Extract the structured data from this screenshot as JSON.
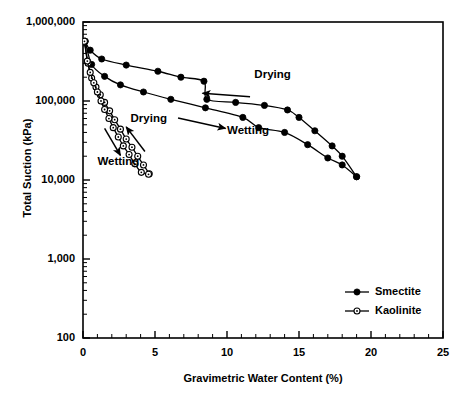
{
  "chart_data": {
    "type": "line",
    "title": "",
    "xlabel": "Gravimetric Water Content (%)",
    "ylabel": "Total Suction (kPa)",
    "xlim": [
      0,
      25
    ],
    "ylim": [
      100,
      1000000
    ],
    "yscale": "log",
    "xscale": "linear",
    "grid": false,
    "xticks": [
      "0",
      "5",
      "10",
      "15",
      "20",
      "25"
    ],
    "xtick_values": [
      0,
      5,
      10,
      15,
      20,
      25
    ],
    "xtick_minor_step": 1,
    "yticks": [
      "100",
      "1,000",
      "10,000",
      "100,000",
      "1,000,000"
    ],
    "ytick_values": [
      100,
      1000,
      10000,
      100000,
      1000000
    ],
    "legend_position": "lower-right",
    "legend": [
      {
        "name": "Smectite",
        "marker": "filled-circle"
      },
      {
        "name": "Kaolinite",
        "marker": "open-circle"
      }
    ],
    "annotations": [
      {
        "text": "Drying",
        "x": 11.9,
        "y": 210000,
        "arrow_from": [
          11.6,
          113000
        ],
        "arrow_to": [
          8.3,
          125000
        ]
      },
      {
        "text": "Wetting",
        "x": 10.0,
        "y": 41000,
        "arrow_from": [
          6.6,
          61000
        ],
        "arrow_to": [
          9.9,
          45000
        ]
      },
      {
        "text": "Drying",
        "x": 3.3,
        "y": 58000,
        "arrow_from": [
          4.3,
          23000
        ],
        "arrow_to": [
          3.0,
          47000
        ]
      },
      {
        "text": "Wetting",
        "x": 1.0,
        "y": 16500,
        "arrow_from": [
          1.5,
          45000
        ],
        "arrow_to": [
          2.6,
          20500
        ]
      }
    ],
    "series": [
      {
        "name": "Smectite",
        "branch": "drying",
        "marker": "filled-circle",
        "points": [
          [
            0.15,
            570000
          ],
          [
            0.5,
            440000
          ],
          [
            1.3,
            340000
          ],
          [
            3.0,
            285000
          ],
          [
            5.2,
            238000
          ],
          [
            6.8,
            200000
          ],
          [
            8.4,
            178000
          ],
          [
            8.6,
            105000
          ],
          [
            10.6,
            96000
          ],
          [
            12.6,
            88000
          ],
          [
            14.2,
            77000
          ],
          [
            15.0,
            62000
          ],
          [
            16.1,
            42000
          ],
          [
            17.3,
            27000
          ],
          [
            18.0,
            20000
          ],
          [
            19.0,
            11000
          ]
        ]
      },
      {
        "name": "Smectite",
        "branch": "wetting",
        "marker": "filled-circle",
        "points": [
          [
            0.15,
            570000
          ],
          [
            0.6,
            290000
          ],
          [
            1.5,
            205000
          ],
          [
            2.6,
            160000
          ],
          [
            4.2,
            130000
          ],
          [
            6.1,
            105000
          ],
          [
            8.5,
            82000
          ],
          [
            11.1,
            62000
          ],
          [
            12.2,
            46000
          ],
          [
            14.0,
            40000
          ],
          [
            15.6,
            28000
          ],
          [
            17.0,
            19000
          ],
          [
            18.0,
            15500
          ],
          [
            19.0,
            11000
          ]
        ]
      },
      {
        "name": "Kaolinite",
        "branch": "drying",
        "marker": "open-circle",
        "points": [
          [
            0.1,
            570000
          ],
          [
            0.35,
            300000
          ],
          [
            0.6,
            195000
          ],
          [
            0.9,
            150000
          ],
          [
            1.2,
            120000
          ],
          [
            1.5,
            96000
          ],
          [
            1.85,
            75000
          ],
          [
            2.2,
            58000
          ],
          [
            2.6,
            44000
          ],
          [
            3.0,
            33000
          ],
          [
            3.4,
            26000
          ],
          [
            3.8,
            20000
          ],
          [
            4.2,
            15500
          ],
          [
            4.6,
            12000
          ]
        ]
      },
      {
        "name": "Kaolinite",
        "branch": "wetting",
        "marker": "open-circle",
        "points": [
          [
            0.1,
            570000
          ],
          [
            0.3,
            320000
          ],
          [
            0.5,
            230000
          ],
          [
            0.75,
            170000
          ],
          [
            1.0,
            130000
          ],
          [
            1.25,
            100000
          ],
          [
            1.5,
            78000
          ],
          [
            1.8,
            60000
          ],
          [
            2.1,
            46000
          ],
          [
            2.45,
            35000
          ],
          [
            2.8,
            27000
          ],
          [
            3.2,
            21000
          ],
          [
            3.6,
            16000
          ],
          [
            4.05,
            12500
          ],
          [
            4.55,
            11800
          ]
        ]
      }
    ]
  },
  "style": {
    "line_color": "#000000",
    "marker_fill_smectite": "#000000",
    "marker_fill_kaolinite": "#ffffff",
    "axis_color": "#000000",
    "background": "#ffffff"
  }
}
